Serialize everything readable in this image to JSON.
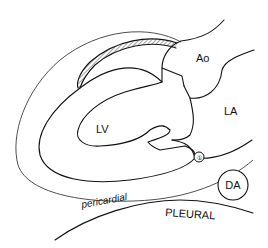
{
  "diagram": {
    "type": "anatomical-line-drawing",
    "labels": {
      "aorta": "Ao",
      "left_atrium": "LA",
      "left_ventricle": "LV",
      "descending_aorta": "DA",
      "pericardial": "pericardial",
      "pleural": "PLEURAL",
      "marker": "①"
    },
    "colors": {
      "line": "#111111",
      "background": "#ffffff",
      "hatch": "#333333"
    }
  }
}
